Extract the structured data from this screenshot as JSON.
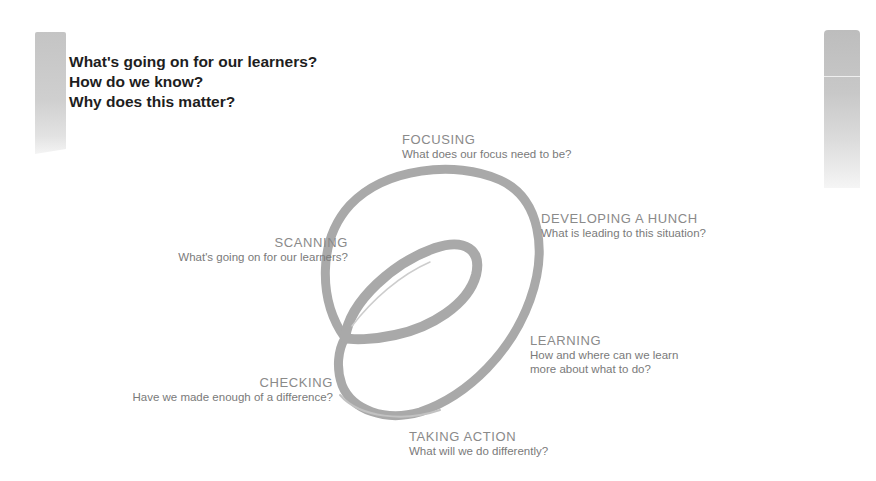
{
  "header": {
    "questions": [
      "What's going on for our learners?",
      "How do we know?",
      "Why does this matter?"
    ]
  },
  "spiral": {
    "stages": [
      {
        "id": "focusing",
        "title": "FOCUSING",
        "desc": "What does our focus need to be?"
      },
      {
        "id": "developing",
        "title": "DEVELOPING A HUNCH",
        "desc": "What is leading to this situation?"
      },
      {
        "id": "learning",
        "title": "LEARNING",
        "desc_line1": "How and where can we learn",
        "desc_line2": "more about what to do?"
      },
      {
        "id": "taking-action",
        "title": "TAKING ACTION",
        "desc": "What will we do differently?"
      },
      {
        "id": "checking",
        "title": "CHECKING",
        "desc": "Have we made enough of a difference?"
      },
      {
        "id": "scanning",
        "title": "SCANNING",
        "desc": "What's going on for our learners?"
      }
    ],
    "stroke_color": "#a6a6a6",
    "bar_color": "#c4c4c4"
  }
}
